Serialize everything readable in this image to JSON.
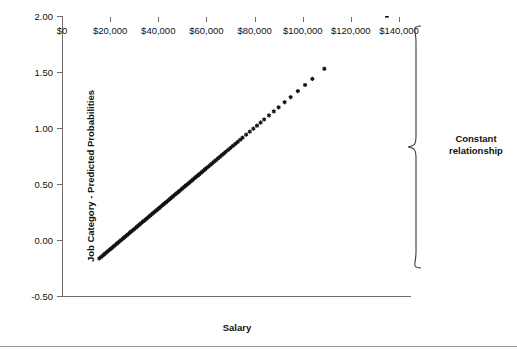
{
  "chart_data": {
    "type": "scatter",
    "title": "",
    "xlabel": "Salary",
    "ylabel": "Job Category - Predicted Probabilities",
    "xlim": [
      0,
      145000
    ],
    "ylim": [
      -0.5,
      2.0
    ],
    "grid": false,
    "legend": null,
    "marker": "star",
    "marker_color": "#111111",
    "xticks": [
      0,
      20000,
      40000,
      60000,
      80000,
      100000,
      120000,
      140000
    ],
    "xtick_labels": [
      "$0",
      "$20,000",
      "$40,000",
      "$60,000",
      "$80,000",
      "$100,000",
      "$120,000",
      "$140,000"
    ],
    "yticks": [
      -0.5,
      0.0,
      0.5,
      1.0,
      1.5,
      2.0
    ],
    "ytick_labels": [
      "-0.50",
      "0.00",
      "0.50",
      "1.00",
      "1.50",
      "2.00"
    ],
    "annotations": [
      {
        "name": "constant-relationship",
        "text": "Constant relationship",
        "text_lines": [
          "Constant",
          "relationship"
        ],
        "shape": "right-curly-brace",
        "y_range": [
          -0.44,
          1.96
        ]
      }
    ],
    "relationship": "linear",
    "fit": {
      "slope_per_dollar": 1.81e-05,
      "intercept": -0.44
    },
    "points": [
      {
        "x": 15500,
        "y": -0.165
      },
      {
        "x": 16200,
        "y": -0.152
      },
      {
        "x": 16800,
        "y": -0.141
      },
      {
        "x": 17400,
        "y": -0.13
      },
      {
        "x": 18000,
        "y": -0.119
      },
      {
        "x": 18600,
        "y": -0.108
      },
      {
        "x": 19200,
        "y": -0.098
      },
      {
        "x": 19800,
        "y": -0.087
      },
      {
        "x": 20400,
        "y": -0.076
      },
      {
        "x": 21000,
        "y": -0.065
      },
      {
        "x": 21600,
        "y": -0.054
      },
      {
        "x": 22200,
        "y": -0.043
      },
      {
        "x": 22800,
        "y": -0.032
      },
      {
        "x": 23400,
        "y": -0.022
      },
      {
        "x": 24000,
        "y": -0.011
      },
      {
        "x": 24600,
        "y": 0.0
      },
      {
        "x": 25200,
        "y": 0.011
      },
      {
        "x": 25800,
        "y": 0.022
      },
      {
        "x": 26400,
        "y": 0.033
      },
      {
        "x": 27000,
        "y": 0.043
      },
      {
        "x": 27600,
        "y": 0.054
      },
      {
        "x": 28200,
        "y": 0.065
      },
      {
        "x": 28800,
        "y": 0.076
      },
      {
        "x": 29400,
        "y": 0.087
      },
      {
        "x": 30000,
        "y": 0.098
      },
      {
        "x": 30600,
        "y": 0.109
      },
      {
        "x": 31200,
        "y": 0.119
      },
      {
        "x": 31800,
        "y": 0.13
      },
      {
        "x": 32400,
        "y": 0.141
      },
      {
        "x": 33000,
        "y": 0.152
      },
      {
        "x": 33600,
        "y": 0.163
      },
      {
        "x": 34200,
        "y": 0.174
      },
      {
        "x": 34800,
        "y": 0.185
      },
      {
        "x": 35400,
        "y": 0.195
      },
      {
        "x": 36000,
        "y": 0.206
      },
      {
        "x": 36600,
        "y": 0.217
      },
      {
        "x": 37200,
        "y": 0.228
      },
      {
        "x": 37800,
        "y": 0.239
      },
      {
        "x": 38400,
        "y": 0.25
      },
      {
        "x": 39000,
        "y": 0.261
      },
      {
        "x": 39600,
        "y": 0.271
      },
      {
        "x": 40200,
        "y": 0.282
      },
      {
        "x": 40800,
        "y": 0.293
      },
      {
        "x": 41400,
        "y": 0.304
      },
      {
        "x": 42000,
        "y": 0.315
      },
      {
        "x": 42600,
        "y": 0.326
      },
      {
        "x": 43200,
        "y": 0.337
      },
      {
        "x": 43800,
        "y": 0.347
      },
      {
        "x": 44400,
        "y": 0.358
      },
      {
        "x": 45000,
        "y": 0.369
      },
      {
        "x": 45600,
        "y": 0.38
      },
      {
        "x": 46200,
        "y": 0.391
      },
      {
        "x": 46800,
        "y": 0.402
      },
      {
        "x": 47400,
        "y": 0.413
      },
      {
        "x": 48000,
        "y": 0.423
      },
      {
        "x": 48600,
        "y": 0.434
      },
      {
        "x": 49200,
        "y": 0.445
      },
      {
        "x": 49800,
        "y": 0.456
      },
      {
        "x": 50400,
        "y": 0.467
      },
      {
        "x": 51000,
        "y": 0.478
      },
      {
        "x": 51600,
        "y": 0.489
      },
      {
        "x": 52200,
        "y": 0.499
      },
      {
        "x": 52800,
        "y": 0.51
      },
      {
        "x": 53400,
        "y": 0.521
      },
      {
        "x": 54000,
        "y": 0.532
      },
      {
        "x": 54600,
        "y": 0.543
      },
      {
        "x": 55200,
        "y": 0.554
      },
      {
        "x": 55800,
        "y": 0.565
      },
      {
        "x": 56400,
        "y": 0.575
      },
      {
        "x": 57000,
        "y": 0.586
      },
      {
        "x": 57600,
        "y": 0.597
      },
      {
        "x": 58200,
        "y": 0.608
      },
      {
        "x": 58800,
        "y": 0.619
      },
      {
        "x": 59400,
        "y": 0.63
      },
      {
        "x": 60000,
        "y": 0.641
      },
      {
        "x": 60800,
        "y": 0.655
      },
      {
        "x": 61600,
        "y": 0.67
      },
      {
        "x": 62400,
        "y": 0.684
      },
      {
        "x": 63200,
        "y": 0.699
      },
      {
        "x": 64000,
        "y": 0.713
      },
      {
        "x": 64800,
        "y": 0.728
      },
      {
        "x": 65600,
        "y": 0.742
      },
      {
        "x": 66400,
        "y": 0.757
      },
      {
        "x": 67200,
        "y": 0.771
      },
      {
        "x": 68000,
        "y": 0.786
      },
      {
        "x": 69000,
        "y": 0.804
      },
      {
        "x": 70000,
        "y": 0.822
      },
      {
        "x": 71000,
        "y": 0.84
      },
      {
        "x": 72000,
        "y": 0.858
      },
      {
        "x": 73000,
        "y": 0.877
      },
      {
        "x": 74000,
        "y": 0.895
      },
      {
        "x": 75000,
        "y": 0.913
      },
      {
        "x": 76500,
        "y": 0.94
      },
      {
        "x": 78000,
        "y": 0.967
      },
      {
        "x": 79500,
        "y": 0.994
      },
      {
        "x": 81000,
        "y": 1.021
      },
      {
        "x": 82500,
        "y": 1.049
      },
      {
        "x": 84000,
        "y": 1.076
      },
      {
        "x": 86000,
        "y": 1.112
      },
      {
        "x": 88000,
        "y": 1.148
      },
      {
        "x": 90000,
        "y": 1.184
      },
      {
        "x": 92500,
        "y": 1.23
      },
      {
        "x": 95000,
        "y": 1.275
      },
      {
        "x": 98000,
        "y": 1.329
      },
      {
        "x": 101000,
        "y": 1.384
      },
      {
        "x": 104000,
        "y": 1.438
      },
      {
        "x": 109000,
        "y": 1.529
      },
      {
        "x": 135000,
        "y": 2.0
      }
    ]
  }
}
